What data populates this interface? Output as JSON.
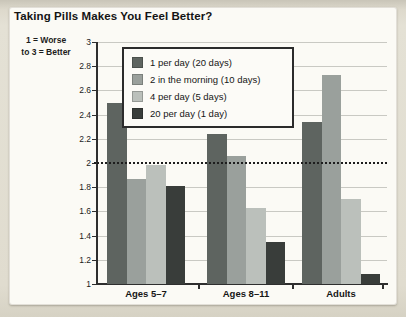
{
  "title": "Taking Pills Makes You Feel Better?",
  "y_axis_note": {
    "line1": "1 = Worse",
    "line2": "to 3 = Better"
  },
  "chart_data": {
    "type": "bar",
    "title": "Taking Pills Makes You Feel Better?",
    "categories": [
      "Ages 5–7",
      "Ages 8–11",
      "Adults"
    ],
    "series": [
      {
        "name": "1 per day (20 days)",
        "color": "#5e6460",
        "values": [
          2.5,
          2.24,
          2.34
        ]
      },
      {
        "name": "2 in the morning (10 days)",
        "color": "#9aa09c",
        "values": [
          1.87,
          2.06,
          2.73
        ]
      },
      {
        "name": "4 per day (5 days)",
        "color": "#bbc0bb",
        "values": [
          1.98,
          1.63,
          1.7
        ]
      },
      {
        "name": "20 per day (1 day)",
        "color": "#393d3a",
        "values": [
          1.81,
          1.35,
          1.08
        ]
      }
    ],
    "ylabel": "1 = Worse to 3 = Better",
    "xlabel": "",
    "ylim": [
      1,
      3
    ],
    "ytick_labels": [
      "3",
      "2.8",
      "2.6",
      "2.4",
      "2.2",
      "2",
      "1.8",
      "1.6",
      "1.4",
      "1.2",
      "1"
    ],
    "reference_line": 2,
    "grid": true,
    "legend_position": "top-center-inside",
    "colors": {
      "gridline": "#c9c9c3",
      "axis": "#2e2e2e",
      "reference_line": "#1d1d1d",
      "panel_background": "#fbfaf5",
      "page_background": "#e0dccf"
    }
  }
}
